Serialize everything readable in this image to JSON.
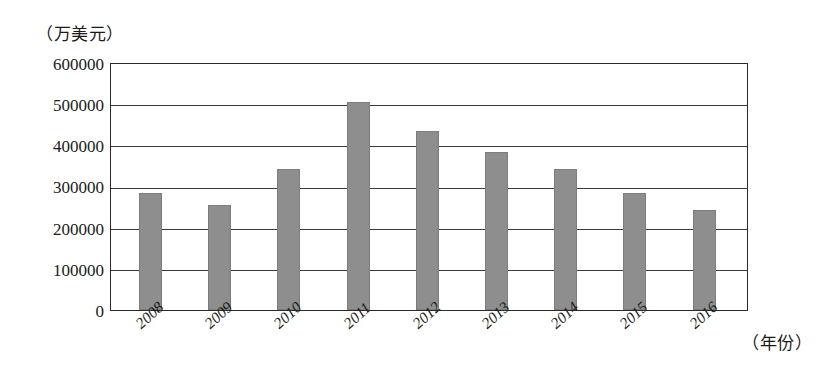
{
  "chart_data": {
    "type": "bar",
    "title": "",
    "subtitle": "",
    "xlabel": "（年份）",
    "ylabel": "（万美元）",
    "categories": [
      "2008",
      "2009",
      "2010",
      "2011",
      "2012",
      "2013",
      "2014",
      "2015",
      "2016"
    ],
    "values": [
      285000,
      255000,
      345000,
      508000,
      437000,
      386000,
      345000,
      285000,
      245000
    ],
    "ylim": [
      0,
      600000
    ],
    "ytick_labels": [
      "0",
      "100000",
      "200000",
      "300000",
      "400000",
      "500000",
      "600000"
    ],
    "ytick_values": [
      0,
      100000,
      200000,
      300000,
      400000,
      500000,
      600000
    ],
    "grid": true,
    "legend": false,
    "legend_position": "none",
    "bar_color": "#8e8e8e",
    "axis_color": "#2b2b2b",
    "gridline_color": "#3a3a3a",
    "background_color": "#ffffff",
    "xtick_rotation_degrees": -42
  }
}
